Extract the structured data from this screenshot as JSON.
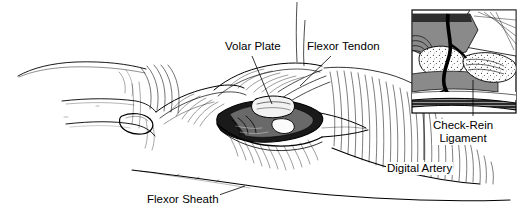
{
  "figure": {
    "kind": "medical-line-illustration",
    "background_color": "#ffffff",
    "ink_color": "#000000",
    "shade_gray": "#8a8a8a",
    "width": 519,
    "height": 219
  },
  "labels": {
    "volar_plate": "Volar Plate",
    "flexor_tendon": "Flexor Tendon",
    "flexor_sheath": "Flexor Sheath",
    "digital_artery": "Digital Artery",
    "check_rein_line1": "Check-Rein",
    "check_rein_line2": "Ligament"
  },
  "inset": {
    "name": "sagittal-detail-inset",
    "x": 412,
    "y": 10,
    "width": 104,
    "height": 103,
    "border_color": "#000000"
  },
  "leaders": [
    {
      "name": "volar-plate-leader",
      "from": [
        252,
        56
      ],
      "to": [
        272,
        104
      ]
    },
    {
      "name": "flexor-tendon-leader",
      "from": [
        331,
        56
      ],
      "to": [
        300,
        86
      ]
    },
    {
      "name": "flexor-sheath-leader",
      "from": [
        216,
        196
      ],
      "to": [
        243,
        186
      ]
    },
    {
      "name": "digital-artery-leader",
      "from": [
        424,
        113
      ],
      "to": [
        424,
        160
      ]
    },
    {
      "name": "check-rein-leader",
      "from": [
        473,
        80
      ],
      "to": [
        473,
        116
      ]
    }
  ]
}
